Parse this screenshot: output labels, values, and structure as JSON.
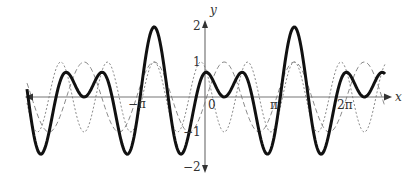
{
  "chart_data": {
    "type": "line",
    "title": "",
    "xlabel": "x",
    "ylabel": "y",
    "xlim": [
      -8.1,
      8.1
    ],
    "ylim": [
      -2,
      2
    ],
    "grid": false,
    "legend": null,
    "x_ticks": [
      {
        "value": -3.14159,
        "label": "−π"
      },
      {
        "value": 0,
        "label": "0"
      },
      {
        "value": 3.14159,
        "label": "π"
      },
      {
        "value": 6.28318,
        "label": "2π"
      }
    ],
    "y_ticks": [
      {
        "value": 2,
        "label": "2"
      },
      {
        "value": 1,
        "label": "1"
      },
      {
        "value": -1,
        "label": "−1"
      },
      {
        "value": -2,
        "label": "−2"
      }
    ],
    "series": [
      {
        "name": "component-1 (long dashed)",
        "style": "dashed",
        "formula": "cos(2(x - x0))",
        "x0": -2.28,
        "amplitude": 1
      },
      {
        "name": "component-2 (short dotted)",
        "style": "dotted",
        "formula": "cos(3(x - x0))",
        "x0": -2.28,
        "amplitude": 1
      },
      {
        "name": "sum (thick solid)",
        "style": "solid-thick",
        "formula": "cos(2(x - x0)) + cos(3(x - x0))",
        "x0": -2.28,
        "amplitude": 2
      }
    ],
    "key_points_sum": {
      "maxima": [
        [
          -2.28,
          2
        ],
        [
          4.0,
          2
        ]
      ],
      "approx_sample_x": [
        -8.1,
        -7.0,
        -6.0,
        -5.0,
        -4.0,
        -3.0,
        -2.28,
        -1.5,
        -1.0,
        0,
        1.0,
        2.0,
        3.0,
        4.0,
        5.0,
        6.0,
        7.0,
        8.1
      ]
    }
  },
  "axes": {
    "x_label": "x",
    "y_label": "y",
    "tick_labels": {
      "neg_pi": "−π",
      "zero": "0",
      "pi": "π",
      "two_pi": "2π",
      "y2": "2",
      "y1": "1",
      "yneg1": "−1",
      "yneg2": "−2"
    }
  },
  "colors": {
    "axis": "#777777",
    "sum": "#111111",
    "dashed": "#888888",
    "dotted": "#888888"
  }
}
